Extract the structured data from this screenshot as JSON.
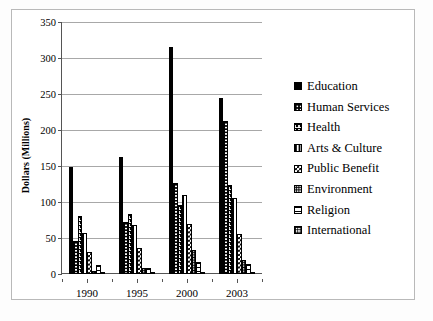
{
  "chart_data": {
    "type": "bar",
    "title": "",
    "xlabel": "",
    "ylabel": "Dollars (Millions)",
    "ylim": [
      0,
      350
    ],
    "yticks": [
      0,
      50,
      100,
      150,
      200,
      250,
      300,
      350
    ],
    "ytick_labels": [
      "0",
      "50",
      "100",
      "150",
      "200",
      "250",
      "300",
      "350"
    ],
    "grid": true,
    "legend_position": "right",
    "categories": [
      "1990",
      "1995",
      "2000",
      "2003"
    ],
    "series": [
      {
        "name": "Education",
        "pattern": "solid-black",
        "values": [
          148,
          163,
          315,
          244
        ]
      },
      {
        "name": "Human Services",
        "pattern": "grid-hatch",
        "values": [
          46,
          72,
          127,
          212
        ]
      },
      {
        "name": "Health",
        "pattern": "dotted-rows",
        "values": [
          81,
          84,
          96,
          124
        ]
      },
      {
        "name": "Arts & Culture",
        "pattern": "vertical-lines",
        "values": [
          57,
          68,
          110,
          106
        ]
      },
      {
        "name": "Public Benefit",
        "pattern": "checkerboard",
        "values": [
          30,
          36,
          70,
          56
        ]
      },
      {
        "name": "Environment",
        "pattern": "fine-dots",
        "values": [
          4,
          8,
          34,
          19
        ]
      },
      {
        "name": "Religion",
        "pattern": "horizontal-lines",
        "values": [
          12,
          8,
          17,
          14
        ]
      },
      {
        "name": "International",
        "pattern": "fine-grid",
        "values": [
          1,
          1,
          1,
          1
        ]
      }
    ]
  },
  "colors": {
    "bar_outline": "#000000",
    "gridline": "#a8a8a8",
    "axis": "#555555",
    "background": "#ffffff",
    "border": "#b9b9b9"
  }
}
